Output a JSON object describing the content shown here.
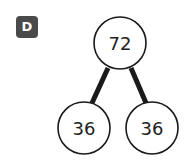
{
  "badge": {
    "label": "D",
    "color": "#4a4a4a"
  },
  "tree": {
    "root": {
      "value": "72"
    },
    "children": [
      {
        "value": "36"
      },
      {
        "value": "36"
      }
    ]
  },
  "colors": {
    "stroke": "#1a1a1a",
    "fill": "#ffffff"
  }
}
